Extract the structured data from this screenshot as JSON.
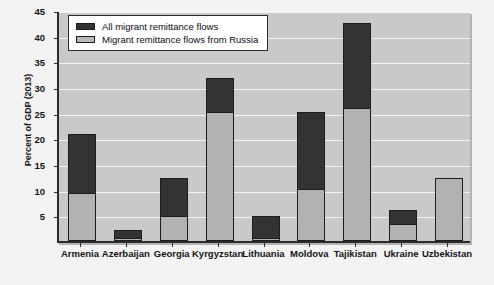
{
  "chart_data": {
    "type": "bar",
    "title": "",
    "subtitle": "",
    "xlabel": "",
    "ylabel": "Percent of GDP (2013)",
    "ylim": [
      0,
      45
    ],
    "ytick_values": [
      5,
      10,
      15,
      20,
      25,
      30,
      35,
      40,
      45
    ],
    "ytick_labels": [
      "5",
      "10",
      "15",
      "20",
      "25",
      "30",
      "35",
      "40",
      "45"
    ],
    "grid": true,
    "legend_position": "upper-left-inside",
    "categories": [
      "Armenia",
      "Azerbaijan",
      "Georgia",
      "Kyrgyzstan",
      "Lithuania",
      "Moldova",
      "Tajikistan",
      "Ukraine",
      "Uzbekistan"
    ],
    "series": [
      {
        "name": "All migrant remittance flows",
        "color": "#333333",
        "values": [
          20.8,
          2.2,
          12.2,
          31.7,
          4.9,
          25.2,
          42.5,
          6.0,
          12.2
        ]
      },
      {
        "name": "Migrant remittance flows from Russia",
        "color": "#b2b2b2",
        "values": [
          9.4,
          0.5,
          4.9,
          25.2,
          0.6,
          10.1,
          25.9,
          3.3,
          12.2
        ]
      }
    ],
    "annotations": []
  },
  "legend": {
    "items": [
      {
        "label": "All migrant remittance flows",
        "swatch": "dark-swatch"
      },
      {
        "label": "Migrant remittance flows from Russia",
        "swatch": "light-swatch"
      }
    ]
  },
  "axes": {
    "y_title": "Percent of GDP (2013)"
  }
}
